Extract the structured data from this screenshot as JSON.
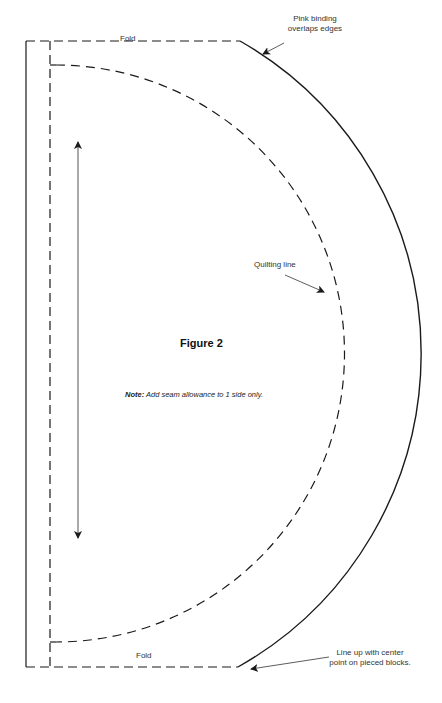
{
  "figure": {
    "title": "Figure 2",
    "note_label": "Note:",
    "note_text": " Add seam allowance to 1 side only."
  },
  "labels": {
    "fold_top": "Fold",
    "fold_bottom": "Fold",
    "quilting_line": "Quilting line",
    "pink_binding_line1": "Pink binding",
    "pink_binding_line2": "overlaps edges",
    "line_up_line1": "Line up with center",
    "line_up_line2": "point on pieced blocks."
  },
  "colors": {
    "line": "#1a1a1a",
    "text": "#333333",
    "grainline": "#555555"
  }
}
